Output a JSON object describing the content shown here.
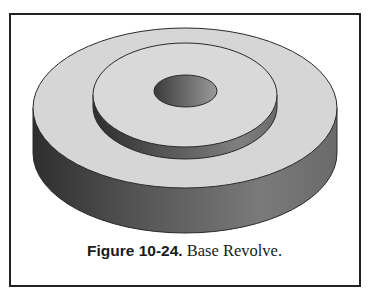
{
  "figure": {
    "label": "Figure 10-24.",
    "title": " Base Revolve.",
    "colors": {
      "frame": "#222222",
      "top_face": "#d6d6d6",
      "side_dark": "#3a3a3a",
      "side_mid": "#6e6e6e",
      "side_light": "#8a8a8a",
      "hole_dark": "#3c3c3c",
      "hole_light": "#8c8c8c",
      "edge": "#2a2a2a"
    }
  }
}
